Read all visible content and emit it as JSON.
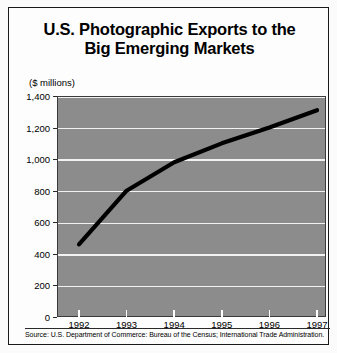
{
  "chart_data": {
    "type": "line",
    "title": "U.S. Photographic Exports to the Big Emerging Markets",
    "title_line1": "U.S. Photographic Exports to the",
    "title_line2": "Big Emerging Markets",
    "unit_note": "($ millions)",
    "xlabel": "",
    "ylabel": "",
    "categories": [
      "1992",
      "1993",
      "1994",
      "1995",
      "1996",
      "1997"
    ],
    "x": [
      1992,
      1993,
      1994,
      1995,
      1996,
      1997
    ],
    "values": [
      460,
      800,
      980,
      1100,
      1200,
      1310
    ],
    "series": [
      {
        "name": "U.S. Photographic Exports",
        "values": [
          460,
          800,
          980,
          1100,
          1200,
          1310
        ]
      }
    ],
    "ylim": [
      0,
      1400
    ],
    "ytick_values": [
      0,
      200,
      400,
      600,
      800,
      1000,
      1200,
      1400
    ],
    "ytick_labels": [
      "0",
      "200",
      "400",
      "600",
      "800",
      "1,000",
      "1,200",
      "1,400"
    ],
    "xtick_labels": [
      "1992",
      "1993",
      "1994",
      "1995",
      "1996",
      "1997"
    ],
    "grid": true,
    "grid_axis": "y",
    "legend": false,
    "legend_position": "none",
    "colors": {
      "plot_background": "#8c8c8c",
      "gridline": "#f2f2f2",
      "line": "#000000",
      "text": "#000000",
      "frame": "#1a1a1a"
    },
    "annotations": []
  },
  "source": {
    "text": "Source: U.S. Department of Commerce: Bureau of the Census; International Trade Administration."
  }
}
